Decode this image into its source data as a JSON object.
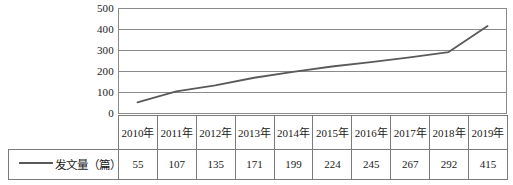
{
  "chart_data": {
    "type": "line",
    "title": "",
    "xlabel": "",
    "ylabel": "",
    "categories": [
      "2010年",
      "2011年",
      "2012年",
      "2013年",
      "2014年",
      "2015年",
      "2016年",
      "2017年",
      "2018年",
      "2019年"
    ],
    "series": [
      {
        "name": "发文量（篇）",
        "values": [
          55,
          107,
          135,
          171,
          199,
          224,
          245,
          267,
          292,
          415
        ]
      }
    ],
    "ylim": [
      0,
      500
    ],
    "yticks": [
      0,
      100,
      200,
      300,
      400,
      500
    ],
    "ytick_labels": [
      "0",
      "100",
      "200",
      "300",
      "400",
      "500"
    ],
    "grid": true,
    "legend_position": "table-left",
    "line_color": "#5a5a5a",
    "grid_color": "#8a8a8a",
    "table_border_color": "#7a7a7a"
  },
  "legend": {
    "series_label": "发文量（篇）"
  },
  "table": {
    "year_header_values": [
      "2010年",
      "2011年",
      "2012年",
      "2013年",
      "2014年",
      "2015年",
      "2016年",
      "2017年",
      "2018年",
      "2019年"
    ],
    "data_values": [
      "55",
      "107",
      "135",
      "171",
      "199",
      "224",
      "245",
      "267",
      "292",
      "415"
    ]
  },
  "axis": {
    "y_tick_labels": [
      "500",
      "400",
      "300",
      "200",
      "100",
      "0"
    ]
  }
}
